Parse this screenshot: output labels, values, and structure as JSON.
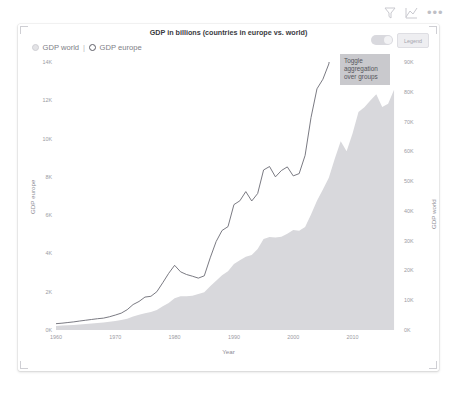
{
  "toolbar": {
    "filter_icon": "filter-icon",
    "focus_icon": "focus-mode-icon",
    "more_label": "•••"
  },
  "card": {
    "title": "GDP in billions (countries in europe vs. world)",
    "legend": {
      "world_label": "GDP world",
      "separator": "|",
      "europe_label": "GDP europe"
    },
    "controls": {
      "toggle_state": "on",
      "button_label": "Legend"
    },
    "tooltip": {
      "line1": "Toggle",
      "line2": "aggregation",
      "line3": "over groups"
    }
  },
  "chart_data": {
    "type": "area",
    "title": "GDP in billions (countries in europe vs. world)",
    "xlabel": "Year",
    "ylabel": "GDP europe",
    "y2label": "GDP world",
    "xlim": [
      1960,
      2018
    ],
    "ylim": [
      0,
      14000
    ],
    "y2lim": [
      0,
      90000
    ],
    "grid": false,
    "legend_position": "top-left",
    "xticks": [
      1960,
      1970,
      1980,
      1990,
      2000,
      2010
    ],
    "xtick_labels": [
      "1960",
      "1970",
      "1980",
      "1990",
      "2000",
      "2010"
    ],
    "yticks": [
      0,
      2000,
      4000,
      6000,
      8000,
      10000,
      12000,
      14000
    ],
    "ytick_labels": [
      "0K",
      "2K",
      "4K",
      "6K",
      "8K",
      "10K",
      "12K",
      "14K"
    ],
    "y2ticks": [
      0,
      10000,
      20000,
      30000,
      40000,
      50000,
      60000,
      70000,
      80000,
      90000
    ],
    "y2tick_labels": [
      "0K",
      "10K",
      "20K",
      "30K",
      "40K",
      "50K",
      "60K",
      "70K",
      "80K",
      "90K"
    ],
    "x": [
      1960,
      1961,
      1962,
      1963,
      1964,
      1965,
      1966,
      1967,
      1968,
      1969,
      1970,
      1971,
      1972,
      1973,
      1974,
      1975,
      1976,
      1977,
      1978,
      1979,
      1980,
      1981,
      1982,
      1983,
      1984,
      1985,
      1986,
      1987,
      1988,
      1989,
      1990,
      1991,
      1992,
      1993,
      1994,
      1995,
      1996,
      1997,
      1998,
      1999,
      2000,
      2001,
      2002,
      2003,
      2004,
      2005,
      2006,
      2007,
      2008,
      2009,
      2010,
      2011,
      2012,
      2013,
      2014,
      2015,
      2016,
      2017
    ],
    "series": [
      {
        "name": "GDP world",
        "axis": "right",
        "render": "area",
        "color": "#d8d8dc",
        "values": [
          1380,
          1470,
          1580,
          1700,
          1870,
          2020,
          2190,
          2320,
          2490,
          2750,
          3030,
          3320,
          3810,
          4570,
          5120,
          5610,
          6030,
          6720,
          7940,
          9100,
          10700,
          11300,
          11300,
          11500,
          12100,
          12700,
          14700,
          16500,
          18400,
          19700,
          22200,
          23400,
          24600,
          25200,
          27200,
          30600,
          31200,
          31100,
          31300,
          32300,
          33600,
          33300,
          34600,
          38800,
          43400,
          47200,
          51100,
          57500,
          63400,
          60000,
          66000,
          73200,
          74800,
          77100,
          79200,
          74900,
          76000,
          80700
        ],
        "values_unit": "billions USD"
      },
      {
        "name": "GDP europe",
        "axis": "left",
        "render": "line",
        "color": "#6b6b74",
        "values": [
          330,
          355,
          390,
          425,
          470,
          510,
          550,
          590,
          620,
          690,
          780,
          880,
          1060,
          1330,
          1490,
          1720,
          1760,
          2000,
          2470,
          2960,
          3380,
          3040,
          2900,
          2810,
          2710,
          2830,
          3770,
          4620,
          5200,
          5400,
          6550,
          6750,
          7230,
          6740,
          7130,
          8360,
          8540,
          8000,
          8330,
          8520,
          8050,
          8170,
          9120,
          11100,
          12600,
          13100,
          13900,
          16000,
          17200,
          15000,
          15200,
          16700,
          15900,
          16500,
          17100,
          14400,
          15100,
          16900
        ],
        "values_unit": "billions USD"
      }
    ]
  }
}
